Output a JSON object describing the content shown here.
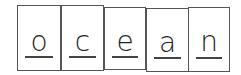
{
  "word": "ocean",
  "cards": [
    {
      "letter": "o",
      "x": 17,
      "y": 5,
      "w": 44,
      "h": 66
    },
    {
      "letter": "c",
      "x": 61,
      "y": 5,
      "w": 43,
      "h": 66
    },
    {
      "letter": "e",
      "x": 104,
      "y": 7,
      "w": 42,
      "h": 63
    },
    {
      "letter": "a",
      "x": 146,
      "y": 8,
      "w": 43,
      "h": 64
    },
    {
      "letter": "n",
      "x": 188,
      "y": 7,
      "w": 42,
      "h": 65
    }
  ]
}
